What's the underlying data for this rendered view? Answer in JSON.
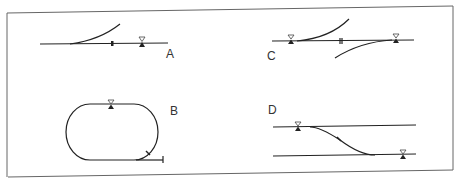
{
  "diagram": {
    "type": "track-layout-schematics",
    "colors": {
      "line": "#222222",
      "frame": "#555555",
      "background": "#ffffff"
    },
    "panels": [
      {
        "id": "A",
        "label": "A",
        "description": "Straight track with a diverging curved branch, an insulated joint, and a signal marker"
      },
      {
        "id": "B",
        "label": "B",
        "description": "Oval loop with a signal marker at top and a spur siding branching off the bottom right"
      },
      {
        "id": "C",
        "label": "C",
        "description": "Straight track with two opposing curved branches, an insulated joint, and signal markers at both ends"
      },
      {
        "id": "D",
        "label": "D",
        "description": "Two parallel tracks joined by a diagonal crossover with signal markers on each track"
      }
    ],
    "legend_symbols": {
      "signal": "hollow triangle above solid triangle",
      "insulated_joint": "short double tick",
      "crossover_mark": "small slanted mark on diagonal"
    }
  }
}
